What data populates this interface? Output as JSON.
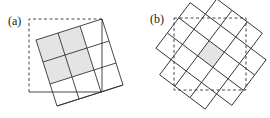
{
  "panels": [
    {
      "label": "(a)",
      "dashed_square": {
        "x": 29,
        "y": 19,
        "size": 73
      },
      "grid": {
        "origin": [
          102,
          19
        ],
        "angle_deg": 162,
        "cell": 23,
        "cols": 3,
        "rows": 4
      },
      "shaded_cells": [
        [
          0,
          1
        ],
        [
          1,
          1
        ],
        [
          0,
          2
        ],
        [
          1,
          2
        ]
      ],
      "shade_color": "#e6e6e6",
      "line_color": "#333333"
    },
    {
      "label": "(b)",
      "dashed_square": {
        "x": 174,
        "y": 18,
        "size": 72
      },
      "grid": {
        "center": [
          211,
          54
        ],
        "angle_deg": 37,
        "cell": 19,
        "cols": 5,
        "rows": 5
      },
      "shaded_cells": [
        [
          2,
          2
        ]
      ],
      "shade_color": "#e6e6e6",
      "line_color": "#333333"
    }
  ]
}
